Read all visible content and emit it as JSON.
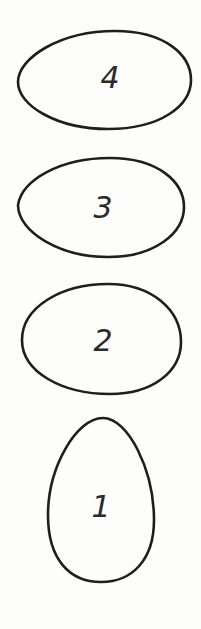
{
  "diagram": {
    "background": "#fdfdfc",
    "stroke_color": "#1e1e1e",
    "eggs": [
      {
        "label": "4",
        "orientation": "horizontal",
        "pointed_end": "left",
        "bbox": {
          "x": 17,
          "y": 30,
          "width": 175,
          "height": 100
        },
        "label_pos": {
          "x": 110,
          "y": 88
        }
      },
      {
        "label": "3",
        "orientation": "horizontal",
        "pointed_end": "left",
        "bbox": {
          "x": 17,
          "y": 157,
          "width": 168,
          "height": 101
        },
        "label_pos": {
          "x": 103,
          "y": 218
        }
      },
      {
        "label": "2",
        "orientation": "horizontal",
        "pointed_end": "none",
        "bbox": {
          "x": 21,
          "y": 283,
          "width": 161,
          "height": 112
        },
        "label_pos": {
          "x": 103,
          "y": 351
        }
      },
      {
        "label": "1",
        "orientation": "vertical",
        "pointed_end": "top",
        "bbox": {
          "x": 47,
          "y": 417,
          "width": 108,
          "height": 166
        },
        "label_pos": {
          "x": 101,
          "y": 517
        }
      }
    ]
  }
}
